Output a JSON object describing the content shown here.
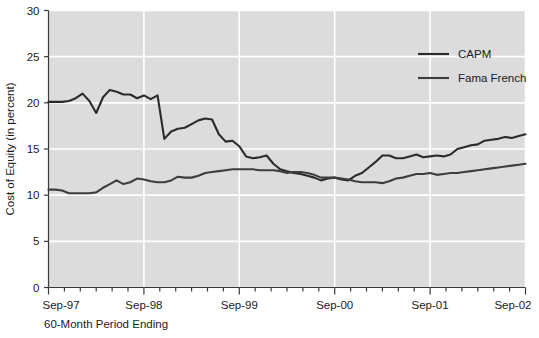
{
  "chart_data": {
    "type": "line",
    "title": "",
    "xlabel": "60-Month Period Ending",
    "ylabel": "Cost of Equity (in percent)",
    "ylim": [
      0,
      30
    ],
    "yticks": [
      0,
      5,
      10,
      15,
      20,
      25,
      30
    ],
    "ytick_labels": [
      "0",
      "5",
      "10",
      "15",
      "20",
      "25",
      "30"
    ],
    "xtick_labels": [
      "Sep-97",
      "Sep-98",
      "Sep-99",
      "Sep-00",
      "Sep-01",
      "Sep-02"
    ],
    "xtick_values": [
      0,
      12,
      24,
      36,
      48,
      60
    ],
    "x_minor_tick_interval_months": 2,
    "x_range_months": [
      0,
      60
    ],
    "grid": "horizontal-and-vertical-white",
    "plot_background": "#dcdcdc",
    "gridline_color": "#ffffff",
    "legend_position": "top-right-inside",
    "series": [
      {
        "name": "CAPM",
        "color": "#2b2b2b",
        "values": [
          20.1,
          20.1,
          20.1,
          20.2,
          20.5,
          21.0,
          20.2,
          18.9,
          20.6,
          21.4,
          21.2,
          20.9,
          20.9,
          20.5,
          20.8,
          20.4,
          20.8,
          16.1,
          16.9,
          17.2,
          17.3,
          17.7,
          18.1,
          18.3,
          18.2,
          16.6,
          15.8,
          15.9,
          15.3,
          14.2,
          14.0,
          14.1,
          14.3,
          13.4,
          12.8,
          12.6,
          12.4,
          12.3,
          12.1,
          11.9,
          11.6,
          11.8,
          11.9,
          11.7,
          11.6,
          12.1,
          12.4,
          13.0,
          13.6,
          14.3,
          14.3,
          14.0,
          14.0,
          14.2,
          14.4,
          14.1,
          14.2,
          14.3,
          14.2,
          14.4,
          15.0,
          15.2,
          15.4,
          15.5,
          15.9,
          16.0,
          16.1,
          16.3,
          16.2,
          16.4,
          16.6
        ]
      },
      {
        "name": "Fama French",
        "color": "#3d3d3d",
        "values": [
          10.6,
          10.6,
          10.5,
          10.2,
          10.2,
          10.2,
          10.2,
          10.3,
          10.8,
          11.2,
          11.6,
          11.2,
          11.4,
          11.8,
          11.7,
          11.5,
          11.4,
          11.4,
          11.6,
          12.0,
          11.9,
          11.9,
          12.1,
          12.4,
          12.5,
          12.6,
          12.7,
          12.8,
          12.8,
          12.8,
          12.8,
          12.7,
          12.7,
          12.7,
          12.6,
          12.4,
          12.5,
          12.5,
          12.4,
          12.2,
          11.9,
          11.9,
          11.9,
          11.8,
          11.7,
          11.5,
          11.4,
          11.4,
          11.4,
          11.3,
          11.5,
          11.8,
          11.9,
          12.1,
          12.3,
          12.3,
          12.4,
          12.2,
          12.3,
          12.4,
          12.4,
          12.5,
          12.6,
          12.7,
          12.8,
          12.9,
          13.0,
          13.1,
          13.2,
          13.3,
          13.4
        ]
      }
    ]
  }
}
